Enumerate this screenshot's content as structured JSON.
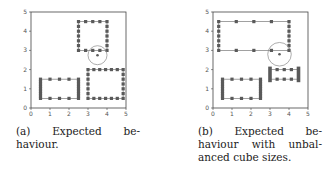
{
  "figures": [
    {
      "id": "a",
      "caption": {
        "lines": [
          [
            "(a)",
            "Expected",
            "be-"
          ],
          [
            "haviour."
          ]
        ]
      },
      "chart_data": {
        "type": "scatter",
        "xlim": [
          0,
          5
        ],
        "ylim": [
          0,
          5
        ],
        "xticks": [
          "0",
          "1",
          "2",
          "3",
          "4",
          "5"
        ],
        "yticks": [
          "0",
          "1",
          "2",
          "3",
          "4",
          "5"
        ],
        "grid": false,
        "rectangles": [
          {
            "x0": 2.5,
            "x1": 4.0,
            "y0": 3.0,
            "y1": 4.5,
            "nx": 5,
            "ny": 7
          },
          {
            "x0": 0.5,
            "x1": 2.5,
            "y0": 0.5,
            "y1": 1.5,
            "nx": 5,
            "ny": 9
          },
          {
            "x0": 3.0,
            "x1": 4.85,
            "y0": 0.5,
            "y1": 2.0,
            "nx": 7,
            "ny": 7
          }
        ],
        "circle": {
          "cx": 3.5,
          "cy": 2.75,
          "r": 0.5
        }
      }
    },
    {
      "id": "b",
      "caption": {
        "lines": [
          [
            "(b)",
            "Expected",
            "be-"
          ],
          [
            "haviour",
            "with",
            "unbal-"
          ],
          [
            "anced cube sizes."
          ]
        ]
      },
      "chart_data": {
        "type": "scatter",
        "xlim": [
          0,
          5
        ],
        "ylim": [
          0,
          5
        ],
        "xticks": [
          "0",
          "1",
          "2",
          "3",
          "4",
          "5"
        ],
        "yticks": [
          "0",
          "1",
          "2",
          "3",
          "4",
          "5"
        ],
        "grid": false,
        "rectangles": [
          {
            "x0": 0.3,
            "x1": 4.0,
            "y0": 3.0,
            "y1": 4.5,
            "nx": 5,
            "ny": 7
          },
          {
            "x0": 0.5,
            "x1": 2.5,
            "y0": 0.5,
            "y1": 1.5,
            "nx": 5,
            "ny": 9
          },
          {
            "x0": 3.0,
            "x1": 4.5,
            "y0": 1.5,
            "y1": 2.0,
            "nx": 5,
            "ny": 2,
            "thick_sides": true
          }
        ],
        "circle": {
          "cx": 3.5,
          "cy": 2.8,
          "r": 0.62
        }
      }
    }
  ],
  "style": {
    "marker_color": "#5a5a5a",
    "line_color": "#8a8a8a",
    "axis_color": "#444444"
  }
}
